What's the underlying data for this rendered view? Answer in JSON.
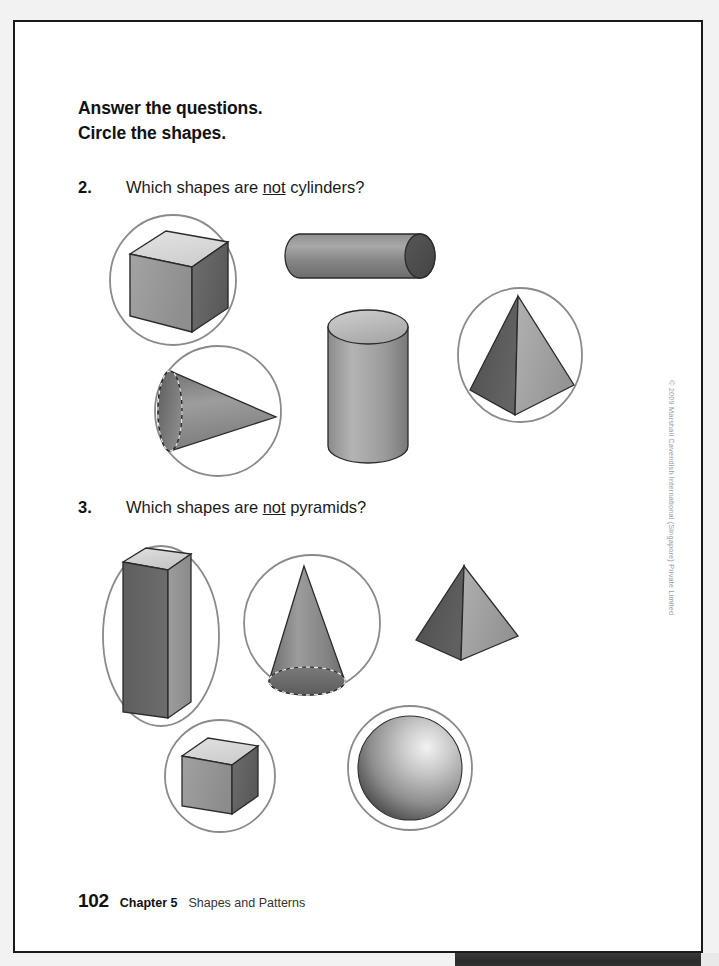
{
  "page": {
    "background_color": "#f2f2f2",
    "paper_color": "#ffffff",
    "border_color": "#1a1a1a",
    "circle_color": "#8a8a8a"
  },
  "instructions": {
    "line1": "Answer the questions.",
    "line2": "Circle the shapes."
  },
  "questions": [
    {
      "number": "2.",
      "prompt_before": "Which shapes are ",
      "prompt_emphasis": "not",
      "prompt_after": " cylinders?",
      "shapes": [
        {
          "name": "cube",
          "circled": true
        },
        {
          "name": "cylinder-horizontal",
          "circled": false
        },
        {
          "name": "cone-sideways",
          "circled": true
        },
        {
          "name": "cylinder-vertical",
          "circled": false
        },
        {
          "name": "pyramid",
          "circled": true
        }
      ]
    },
    {
      "number": "3.",
      "prompt_before": "Which shapes are ",
      "prompt_emphasis": "not",
      "prompt_after": " pyramids?",
      "shapes": [
        {
          "name": "rectangular-prism",
          "circled": true
        },
        {
          "name": "cone-upright",
          "circled": true
        },
        {
          "name": "pyramid",
          "circled": false
        },
        {
          "name": "cube-small",
          "circled": true
        },
        {
          "name": "sphere",
          "circled": true
        }
      ]
    }
  ],
  "footer": {
    "page_number": "102",
    "chapter": "Chapter 5",
    "chapter_title": "Shapes and Patterns"
  },
  "copyright": "© 2009 Marshall Cavendish International (Singapore) Private Limited"
}
